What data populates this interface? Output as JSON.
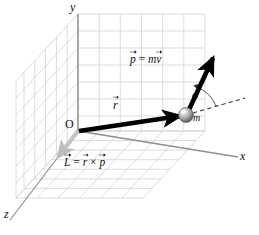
{
  "figure": {
    "axes": {
      "x_label": "x",
      "y_label": "y",
      "z_label": "z",
      "origin_label": "O"
    },
    "labels": {
      "position_vector": "r",
      "momentum_vector": "p",
      "momentum_equation_lhs": "p",
      "momentum_equation_eq": " = ",
      "momentum_equation_m": "m",
      "momentum_equation_v": "v",
      "angular_momentum_L": "L",
      "angular_momentum_eq": " = ",
      "angular_momentum_r": "r",
      "angular_momentum_cross": " × ",
      "angular_momentum_p": "p",
      "mass_label": "m",
      "angle_label": "ϕ"
    },
    "colors": {
      "grid": "#c9c9c9",
      "axis": "#9a9a9a",
      "vector": "#000000",
      "angular_momentum_vector": "#c0c0c0",
      "sphere_light": "#f2f2f2",
      "sphere_mid": "#9d9d9d",
      "sphere_dark": "#5a5a5a",
      "dashed": "#3a3a3a",
      "background": "#ffffff"
    },
    "geometry": {
      "origin": [
        78,
        131
      ],
      "mass_point": [
        186,
        115
      ],
      "momentum_tip": [
        212,
        57
      ],
      "x_axis_end": [
        238,
        157
      ],
      "y_axis_top": [
        78,
        14
      ],
      "z_axis_end": [
        16,
        214
      ],
      "dashed_end": [
        243,
        99
      ],
      "angle_degrees": 62
    }
  }
}
